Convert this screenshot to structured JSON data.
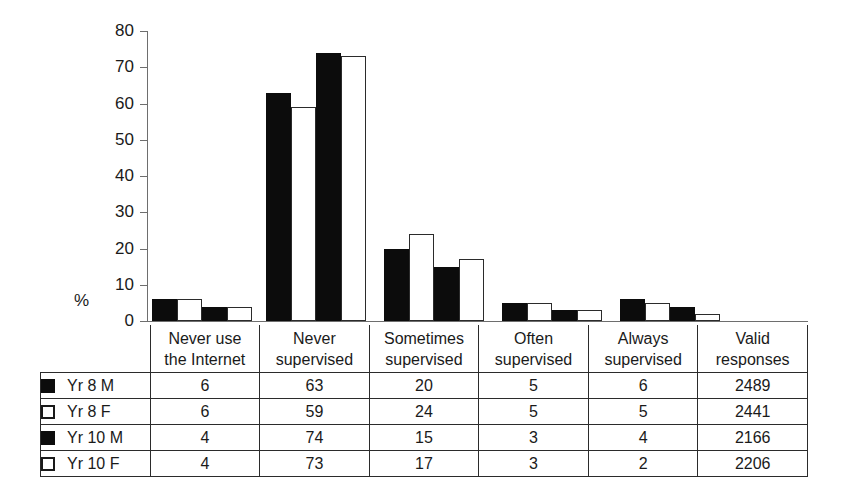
{
  "axis": {
    "y_unit_label": "%",
    "y_ticks": [
      "80",
      "70",
      "60",
      "50",
      "40",
      "30",
      "20",
      "10",
      "0"
    ]
  },
  "table": {
    "column_headers": [
      {
        "line1": "Never use",
        "line2": "the Internet"
      },
      {
        "line1": "Never",
        "line2": "supervised"
      },
      {
        "line1": "Sometimes",
        "line2": "supervised"
      },
      {
        "line1": "Often",
        "line2": "supervised"
      },
      {
        "line1": "Always",
        "line2": "supervised"
      },
      {
        "line1": "Valid",
        "line2": "responses"
      }
    ],
    "rows": [
      {
        "label": "Yr 8 M",
        "swatch": "solid",
        "values": [
          "6",
          "63",
          "20",
          "5",
          "6",
          "2489"
        ]
      },
      {
        "label": "Yr 8 F",
        "swatch": "hollow",
        "values": [
          "6",
          "59",
          "24",
          "5",
          "5",
          "2441"
        ]
      },
      {
        "label": "Yr 10 M",
        "swatch": "solid",
        "values": [
          "4",
          "74",
          "15",
          "3",
          "4",
          "2166"
        ]
      },
      {
        "label": "Yr 10 F",
        "swatch": "hollow",
        "values": [
          "4",
          "73",
          "17",
          "3",
          "2",
          "2206"
        ]
      }
    ]
  },
  "chart_data": {
    "type": "bar",
    "title": "",
    "xlabel": "",
    "ylabel": "%",
    "ylim": [
      0,
      80
    ],
    "ytick_step": 10,
    "grid": false,
    "legend_position": "table-row-labels",
    "categories": [
      "Never use the Internet",
      "Never supervised",
      "Sometimes supervised",
      "Often supervised",
      "Always supervised"
    ],
    "series": [
      {
        "name": "Yr 8 M",
        "style": "solid",
        "color": "#0c0c0c",
        "values": [
          6,
          63,
          20,
          5,
          6
        ],
        "valid_responses": 2489
      },
      {
        "name": "Yr 8 F",
        "style": "hollow",
        "color": "#ffffff",
        "values": [
          6,
          59,
          24,
          5,
          5
        ],
        "valid_responses": 2441
      },
      {
        "name": "Yr 10 M",
        "style": "solid",
        "color": "#0c0c0c",
        "values": [
          4,
          74,
          15,
          3,
          4
        ],
        "valid_responses": 2166
      },
      {
        "name": "Yr 10 F",
        "style": "hollow",
        "color": "#ffffff",
        "values": [
          4,
          73,
          17,
          3,
          2
        ],
        "valid_responses": 2206
      }
    ]
  },
  "layout": {
    "group_left_px": [
      152,
      266,
      384,
      502,
      620
    ],
    "group_width_px": 104,
    "bar_width_px": 25,
    "plot_top_px": 31,
    "plot_bottom_px": 321
  }
}
